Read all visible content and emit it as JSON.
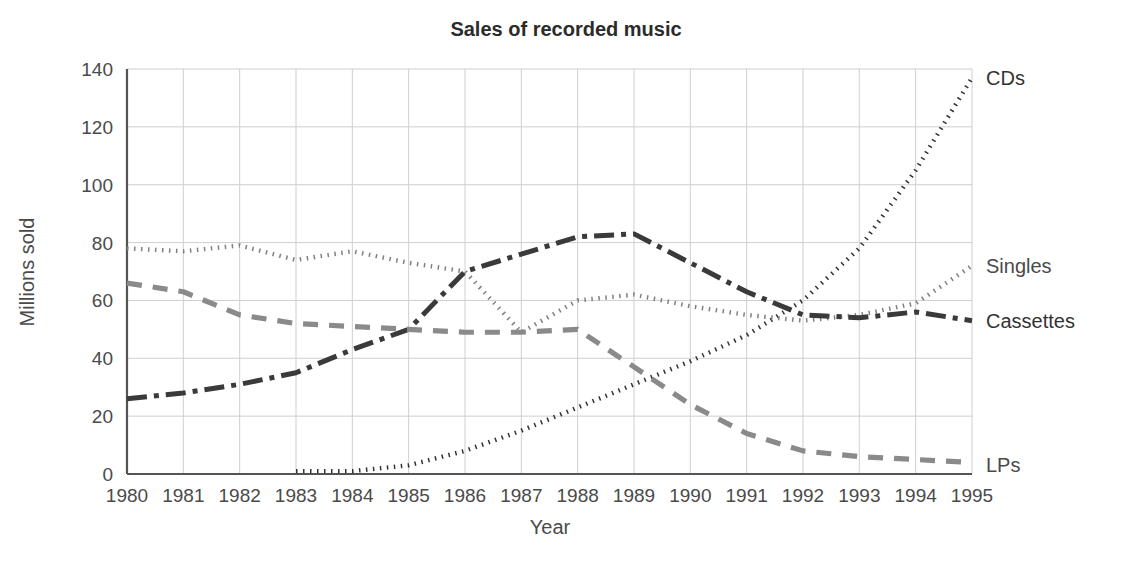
{
  "chart_data": {
    "type": "line",
    "title": "Sales of recorded music",
    "xlabel": "Year",
    "ylabel": "Millions sold",
    "categories": [
      1980,
      1981,
      1982,
      1983,
      1984,
      1985,
      1986,
      1987,
      1988,
      1989,
      1990,
      1991,
      1992,
      1993,
      1994,
      1995
    ],
    "xtick_labels": [
      "1980",
      "1981",
      "1982",
      "1983",
      "1984",
      "1985",
      "1986",
      "1987",
      "1988",
      "1989",
      "1990",
      "1991",
      "1992",
      "1993",
      "1994",
      "1995"
    ],
    "ytick_labels": [
      "0",
      "20",
      "40",
      "60",
      "80",
      "100",
      "120",
      "140"
    ],
    "ytick_values": [
      0,
      20,
      40,
      60,
      80,
      100,
      120,
      140
    ],
    "ylim": [
      0,
      140
    ],
    "xlim": [
      1980,
      1995
    ],
    "grid": true,
    "legend_position": "right-inline",
    "series": [
      {
        "name": "CDs",
        "label": "CDs",
        "color": "#333333",
        "style": "dotted",
        "label_y": 137,
        "values": [
          null,
          null,
          null,
          1,
          1,
          3,
          8,
          15,
          23,
          31,
          39,
          48,
          60,
          78,
          105,
          137
        ]
      },
      {
        "name": "Singles",
        "label": "Singles",
        "color": "#808080",
        "style": "dotted",
        "label_y": 72,
        "values": [
          78,
          77,
          79,
          74,
          77,
          73,
          70,
          49,
          60,
          62,
          58,
          55,
          53,
          55,
          59,
          72
        ]
      },
      {
        "name": "Cassettes",
        "label": "Cassettes",
        "color": "#3a3a3a",
        "style": "dashdot",
        "label_y": 53,
        "values": [
          26,
          28,
          31,
          35,
          43,
          50,
          70,
          76,
          82,
          83,
          73,
          63,
          55,
          54,
          56,
          53
        ]
      },
      {
        "name": "LPs",
        "label": "LPs",
        "color": "#8a8a8a",
        "style": "dashed",
        "label_y": 3,
        "values": [
          66,
          63,
          55,
          52,
          51,
          50,
          49,
          49,
          50,
          37,
          24,
          14,
          8,
          6,
          5,
          4
        ]
      }
    ]
  },
  "colors": {
    "axis": "#555555",
    "grid": "#cfcfcf",
    "text": "#4a4a4a",
    "title": "#2b2b2b"
  }
}
